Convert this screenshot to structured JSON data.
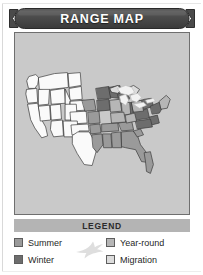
{
  "card": {
    "title": "RANGE MAP",
    "background_color": "#ffffff",
    "border_color": "#d9d9d9"
  },
  "banner": {
    "label": "RANGE MAP",
    "fill_color": "#4a4a4a",
    "text_color": "#ffffff",
    "shape": "notched-ribbon"
  },
  "map": {
    "region": "United States",
    "panel_background": "#c9c9c9",
    "panel_border": "#6f6f6f",
    "unshaded_fill": "#fafafa",
    "lakes_fill": "#f2f2f2",
    "outline_color": "#3a3a3a",
    "shading": {
      "summer": "#9a9a9a",
      "winter": "#6d6d6d",
      "year_round": "#b6b6b6",
      "migration": "#dcdcdc"
    }
  },
  "legend": {
    "header": "LEGEND",
    "header_background": "#b4b4b4",
    "header_text_color": "#2b2b2b",
    "bird_icon": "flying-bird-icon",
    "bird_color": "#dedede",
    "columns": [
      {
        "side": "left",
        "items": [
          {
            "label": "Summer",
            "swatch_color": "#9a9a9a"
          },
          {
            "label": "Winter",
            "swatch_color": "#6d6d6d"
          }
        ]
      },
      {
        "side": "right",
        "items": [
          {
            "label": "Year-round",
            "swatch_color": "#b6b6b6"
          },
          {
            "label": "Migration",
            "swatch_color": "#dcdcdc"
          }
        ]
      }
    ]
  }
}
